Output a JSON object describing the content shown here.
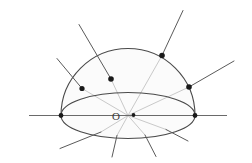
{
  "figure": {
    "width": 252,
    "height": 163,
    "background_color": "#ffffff"
  },
  "labels": {
    "origin": "O"
  },
  "colors": {
    "outline": "#4a4a4a",
    "dome_outline": "#4a4a4a",
    "equator_outline": "#4a4a4a",
    "ray_inner": "#c9c9c9",
    "ray_outer": "#5a5a5a",
    "axis": "#6a6a6a",
    "point_fill": "#1a1a1a",
    "dome_shade": "#fbfbfb",
    "label_color": "#3a3a3a"
  },
  "geometry": {
    "center": {
      "x": 128,
      "y": 115.5
    },
    "dome": {
      "radius": 67,
      "left_x": 61,
      "right_x": 195,
      "apex_x": 128,
      "apex_y": 38.5
    },
    "equator_ellipse": {
      "cx": 128,
      "cy": 115.5,
      "rx": 67,
      "ry": 23
    },
    "horizontal_axis": {
      "x1": 29,
      "y1": 115.5,
      "x2": 227,
      "y2": 115.5
    }
  },
  "surface_points": [
    {
      "name": "point-a",
      "x": 82,
      "y": 88.5,
      "r": 2.6
    },
    {
      "name": "point-b",
      "x": 111,
      "y": 79.0,
      "r": 2.8
    },
    {
      "name": "point-c",
      "x": 162,
      "y": 55.5,
      "r": 2.8
    },
    {
      "name": "point-d",
      "x": 189,
      "y": 87.0,
      "r": 2.8
    }
  ],
  "origin_marker": {
    "x": 133.5,
    "y": 115.0,
    "r": 1.9
  },
  "origin_label_pos": {
    "x": 116,
    "y": 119.5
  },
  "upper_rays": [
    {
      "name": "ray-a",
      "inner_x2": 82,
      "inner_y2": 88.5,
      "outer_x2": 57,
      "outer_y2": 58.5
    },
    {
      "name": "ray-b",
      "inner_x2": 111,
      "inner_y2": 79.0,
      "outer_x2": 79,
      "outer_y2": 24.5
    },
    {
      "name": "ray-c",
      "inner_x2": 162,
      "inner_y2": 55.5,
      "outer_x2": 183,
      "outer_y2": 10.5
    },
    {
      "name": "ray-d",
      "inner_x2": 189,
      "inner_y2": 87.0,
      "outer_x2": 234,
      "outer_y2": 61.0
    }
  ],
  "lower_rays": [
    {
      "name": "lower-ray-a",
      "inner_x2": 101,
      "inner_y2": 132.0,
      "outer_x2": 60,
      "outer_y2": 148.5
    },
    {
      "name": "lower-ray-b",
      "inner_x2": 117,
      "inner_y2": 135.5,
      "outer_x2": 112,
      "outer_y2": 157.0
    },
    {
      "name": "lower-ray-c",
      "inner_x2": 145,
      "inner_y2": 135.0,
      "outer_x2": 156,
      "outer_y2": 156.5
    },
    {
      "name": "lower-ray-d",
      "inner_x2": 166,
      "inner_y2": 129.5,
      "outer_x2": 188,
      "outer_y2": 141.0
    }
  ],
  "edge_points": [
    {
      "name": "equator-left-vertex",
      "x": 61,
      "y": 115.5,
      "r": 2.4
    },
    {
      "name": "equator-right-vertex",
      "x": 195,
      "y": 115.5,
      "r": 2.4
    }
  ]
}
